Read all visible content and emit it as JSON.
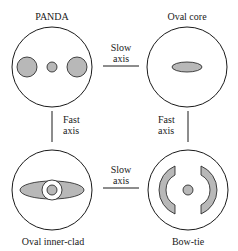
{
  "diagram": {
    "fibers": [
      {
        "id": "panda",
        "label": "PANDA"
      },
      {
        "id": "oval-core",
        "label": "Oval core"
      },
      {
        "id": "oval-inner-clad",
        "label": "Oval inner-clad"
      },
      {
        "id": "bow-tie",
        "label": "Bow-tie"
      }
    ],
    "connectors": {
      "top": {
        "line1": "Slow",
        "line2": "axis"
      },
      "bottom": {
        "line1": "Slow",
        "line2": "axis"
      },
      "left": {
        "line1": "Fast",
        "line2": "axis"
      },
      "right": {
        "line1": "Fast",
        "line2": "axis"
      }
    },
    "colors": {
      "stroke": "#1a1a1a",
      "stress_fill": "#b8b8b8",
      "background": "#ffffff"
    }
  }
}
